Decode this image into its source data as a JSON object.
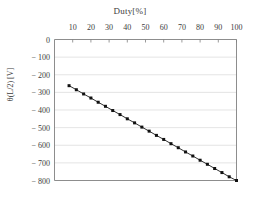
{
  "chart_data": {
    "type": "line",
    "title": "Duty[%]",
    "xlabel": "Duty[%]",
    "ylabel": "θ(L/2)  [V]",
    "xlim": [
      0,
      100
    ],
    "ylim": [
      -800,
      0
    ],
    "grid": true,
    "grid_axis": "y",
    "legend": "none",
    "x_axis_position": "top",
    "xticks": [
      10,
      20,
      30,
      40,
      50,
      60,
      70,
      80,
      90,
      100
    ],
    "xtick_labels": [
      "10",
      "20",
      "30",
      "40",
      "50",
      "60",
      "70",
      "80",
      "90",
      "100"
    ],
    "yticks": [
      0,
      -100,
      -200,
      -300,
      -400,
      -500,
      -600,
      -700,
      -800
    ],
    "ytick_labels": [
      "0",
      "− 100",
      "− 200",
      "− 300",
      "− 400",
      "− 500",
      "− 600",
      "− 700",
      "− 800"
    ],
    "marker": "square",
    "line_color": "#1a1a1a",
    "marker_color": "#111111",
    "grid_color": "#d8d8d8",
    "axis_color": "#808080",
    "x": [
      8,
      12,
      16,
      20,
      24,
      28,
      32,
      36,
      40,
      44,
      48,
      52,
      56,
      60,
      64,
      68,
      72,
      76,
      80,
      84,
      88,
      92,
      96,
      100
    ],
    "values": [
      -262,
      -285,
      -309,
      -332,
      -356,
      -379,
      -403,
      -426,
      -450,
      -473,
      -497,
      -520,
      -544,
      -567,
      -591,
      -614,
      -638,
      -661,
      -685,
      -708,
      -732,
      -755,
      -779,
      -800
    ],
    "series": [
      {
        "name": "theta",
        "x": [
          8,
          12,
          16,
          20,
          24,
          28,
          32,
          36,
          40,
          44,
          48,
          52,
          56,
          60,
          64,
          68,
          72,
          76,
          80,
          84,
          88,
          92,
          96,
          100
        ],
        "values": [
          -262,
          -285,
          -309,
          -332,
          -356,
          -379,
          -403,
          -426,
          -450,
          -473,
          -497,
          -520,
          -544,
          -567,
          -591,
          -614,
          -638,
          -661,
          -685,
          -708,
          -732,
          -755,
          -779,
          -800
        ]
      }
    ]
  }
}
